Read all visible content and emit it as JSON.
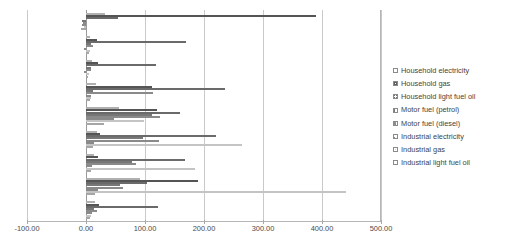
{
  "chart_data": {
    "type": "bar",
    "orientation": "horizontal",
    "title": "",
    "subtitle": "",
    "xlabel": "",
    "ylabel": "",
    "xlim": [
      -100.0,
      500.0
    ],
    "xticks": [
      "-100.00",
      "0.00",
      "100.00",
      "200.00",
      "300.00",
      "400.00",
      "500.00"
    ],
    "xtick_values": [
      -100,
      0,
      100,
      200,
      300,
      400,
      500
    ],
    "grid": true,
    "grid_axis": "x",
    "legend_position": "right",
    "categories": [
      "UK",
      "Spain",
      "Poland",
      "Netherlands",
      "Italy",
      "Germany",
      "France",
      "Denmark",
      "Czech Rep."
    ],
    "series": [
      {
        "name": "Household electricity",
        "pattern": "light-dotted",
        "values": [
          33,
          7,
          10,
          17,
          56,
          19,
          14,
          92,
          15
        ]
      },
      {
        "name": "Household gas",
        "pattern": "dense-checker",
        "values": [
          390,
          18,
          20,
          112,
          120,
          23,
          20,
          190,
          22
        ]
      },
      {
        "name": "Household light fuel oil",
        "pattern": "cross-hatch",
        "values": [
          54,
          170,
          118,
          236,
          160,
          220,
          167,
          103,
          122
        ]
      },
      {
        "name": "Motor fuel (petrol)",
        "pattern": "vertical-lines",
        "values": [
          -6,
          9,
          8,
          12,
          112,
          96,
          78,
          58,
          14
        ]
      },
      {
        "name": "Motor fuel (diesel)",
        "pattern": "horizontal-dashes",
        "values": [
          -5,
          12,
          9,
          113,
          125,
          124,
          85,
          62,
          18
        ]
      },
      {
        "name": "Industrial electricity",
        "pattern": "diagonal-up",
        "values": [
          -7,
          -3,
          -4,
          9,
          48,
          14,
          11,
          20,
          10
        ]
      },
      {
        "name": "Industrial gas",
        "pattern": "very-light-dotted",
        "values": [
          -4,
          6,
          5,
          8,
          98,
          264,
          185,
          440,
          8
        ]
      },
      {
        "name": "Industrial light fuel oil",
        "pattern": "fine-dots",
        "values": [
          -8,
          5,
          4,
          7,
          30,
          12,
          9,
          16,
          6
        ]
      }
    ]
  },
  "legend": {
    "items": [
      {
        "label": "Household electricity"
      },
      {
        "label": "Household gas"
      },
      {
        "label": "Household light fuel oil"
      },
      {
        "label": "Motor fuel (petrol)"
      },
      {
        "label": "Motor fuel (diesel)"
      },
      {
        "label": "Industrial electricity"
      },
      {
        "label": "Industrial gas"
      },
      {
        "label": "Industrial light fuel oil"
      }
    ]
  },
  "colors": {
    "axis": "#b5b5b5",
    "grid": "#c9c9c9",
    "text": "#4a4a4a",
    "bar_outline": "#8a8a8a",
    "background": "#ffffff"
  }
}
